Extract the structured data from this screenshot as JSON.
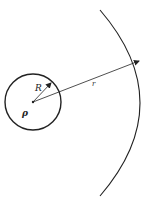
{
  "diagram": {
    "labels": {
      "inner_radius": "R",
      "distance": "r",
      "density": "ρ"
    },
    "colors": {
      "stroke": "#222222",
      "background": "#ffffff"
    }
  }
}
